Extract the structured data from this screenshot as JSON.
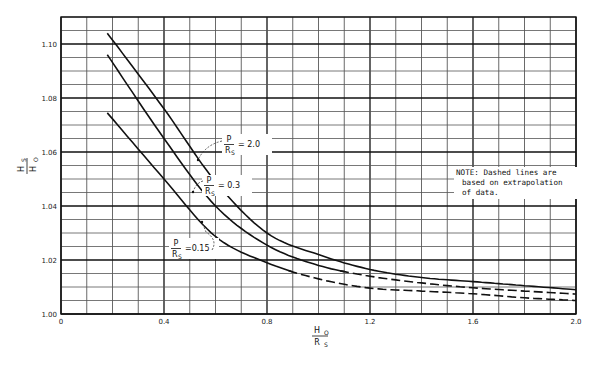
{
  "chart_data": {
    "type": "line",
    "title": "",
    "xlabel": "H_O / R_S",
    "ylabel": "H_S / H_O",
    "xlim": [
      0,
      2.0
    ],
    "ylim": [
      1.0,
      1.11
    ],
    "grid": true,
    "x_ticks": [
      0,
      0.4,
      0.8,
      1.2,
      1.6,
      2.0
    ],
    "x_tick_labels": [
      "0",
      "0.4",
      "0.8",
      "1.2",
      "1.6",
      "2.0"
    ],
    "y_ticks": [
      1.0,
      1.02,
      1.04,
      1.06,
      1.08,
      1.1
    ],
    "y_tick_labels": [
      "1.00",
      "1.02",
      "1.04",
      "1.06",
      "1.08",
      "1.10"
    ],
    "x_minor_step": 0.1,
    "y_minor_step": 0.005,
    "series": [
      {
        "name": "P/R_S = 2.0",
        "x": [
          0.18,
          0.4,
          0.6,
          0.8,
          1.0,
          1.2,
          1.4,
          1.6,
          1.8,
          2.0
        ],
        "y": [
          1.104,
          1.076,
          1.049,
          1.03,
          1.022,
          1.0165,
          1.0135,
          1.012,
          1.0105,
          1.009
        ],
        "solid_until_x": 2.0
      },
      {
        "name": "P/R_S = 0.3",
        "x": [
          0.18,
          0.4,
          0.6,
          0.8,
          1.0,
          1.2,
          1.4,
          1.6,
          1.8,
          2.0
        ],
        "y": [
          1.096,
          1.065,
          1.04,
          1.0255,
          1.018,
          1.014,
          1.0115,
          1.0097,
          1.0085,
          1.0074
        ],
        "solid_until_x": 1.1
      },
      {
        "name": "P/R_S = 0.15",
        "x": [
          0.18,
          0.4,
          0.6,
          0.8,
          1.0,
          1.2,
          1.4,
          1.6,
          1.8,
          2.0
        ],
        "y": [
          1.0745,
          1.05,
          1.0287,
          1.019,
          1.013,
          1.0096,
          1.0085,
          1.0075,
          1.006,
          1.005
        ],
        "solid_until_x": 0.9
      }
    ],
    "annotations": [
      {
        "text": "P/R_S = 2.0",
        "x": 0.62,
        "y": 1.061
      },
      {
        "text": "P/R_S = 0.3",
        "x": 0.58,
        "y": 1.051
      },
      {
        "text": "P/R_S = 0.15",
        "x": 0.42,
        "y": 1.033
      },
      {
        "text": "NOTE: Dashed lines are based on extrapolation of data."
      }
    ],
    "legend": "none (inline labels)"
  },
  "labels": {
    "curve_2_0": {
      "num": "P",
      "den": "R",
      "sub": "S",
      "value": "= 2.0"
    },
    "curve_0_3": {
      "num": "P",
      "den": "R",
      "sub": "S",
      "value": "= 0.3"
    },
    "curve_0_15": {
      "num": "P",
      "den": "R",
      "sub": "S",
      "value": "=0.15"
    },
    "xlabel": {
      "num": "H",
      "num_sub": "O",
      "den": "R",
      "den_sub": "S"
    },
    "ylabel": {
      "num": "H",
      "num_sub": "S",
      "den": "H",
      "den_sub": "O"
    }
  },
  "note": {
    "line1": "NOTE: Dashed lines are",
    "line2": " based on extrapolation",
    "line3": "of data."
  }
}
